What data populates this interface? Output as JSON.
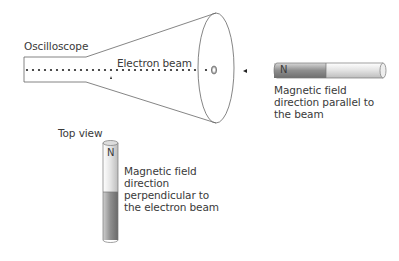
{
  "diagram": {
    "oscilloscope_label": "Oscilloscope",
    "beam_label": "Electron beam",
    "parallel_magnet": {
      "pole_label": "N",
      "caption": [
        "Magnetic field",
        "direction parallel to",
        "the beam"
      ]
    },
    "top_view_label": "Top view",
    "perpendicular_magnet": {
      "pole_label": "N",
      "caption": [
        "Magnetic field",
        "direction",
        "perpendicular to",
        "the electron beam"
      ]
    },
    "colors": {
      "line": "#555555",
      "text": "#3a3a3a",
      "magnet_dark": "#9a9a9a",
      "magnet_light": "#e6e6e6"
    }
  }
}
